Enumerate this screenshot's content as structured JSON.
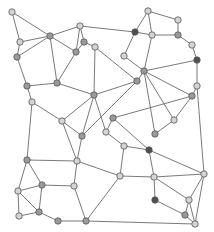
{
  "diagram": {
    "type": "graph",
    "colors": {
      "light": "#d4d4d4",
      "mid": "#9a9a9a",
      "dark": "#505050",
      "edge": "#6a6a6a",
      "node_stroke": "#555555"
    },
    "nodes": [
      {
        "id": 0,
        "x": 12,
        "y": 12,
        "shade": "light"
      },
      {
        "id": 1,
        "x": 20,
        "y": 42,
        "shade": "light"
      },
      {
        "id": 2,
        "x": 17,
        "y": 57,
        "shade": "mid"
      },
      {
        "id": 3,
        "x": 50,
        "y": 36,
        "shade": "mid"
      },
      {
        "id": 4,
        "x": 80,
        "y": 26,
        "shade": "light"
      },
      {
        "id": 5,
        "x": 84,
        "y": 42,
        "shade": "mid"
      },
      {
        "id": 6,
        "x": 76,
        "y": 52,
        "shade": "mid"
      },
      {
        "id": 7,
        "x": 95,
        "y": 47,
        "shade": "light"
      },
      {
        "id": 8,
        "x": 135,
        "y": 32,
        "shade": "dark"
      },
      {
        "id": 9,
        "x": 124,
        "y": 56,
        "shade": "light"
      },
      {
        "id": 10,
        "x": 148,
        "y": 11,
        "shade": "light"
      },
      {
        "id": 11,
        "x": 178,
        "y": 20,
        "shade": "light"
      },
      {
        "id": 12,
        "x": 152,
        "y": 35,
        "shade": "light"
      },
      {
        "id": 13,
        "x": 178,
        "y": 35,
        "shade": "mid"
      },
      {
        "id": 14,
        "x": 192,
        "y": 45,
        "shade": "light"
      },
      {
        "id": 15,
        "x": 197,
        "y": 60,
        "shade": "dark"
      },
      {
        "id": 16,
        "x": 144,
        "y": 71,
        "shade": "mid"
      },
      {
        "id": 17,
        "x": 137,
        "y": 81,
        "shade": "mid"
      },
      {
        "id": 18,
        "x": 27,
        "y": 86,
        "shade": "mid"
      },
      {
        "id": 19,
        "x": 57,
        "y": 83,
        "shade": "mid"
      },
      {
        "id": 20,
        "x": 32,
        "y": 102,
        "shade": "light"
      },
      {
        "id": 21,
        "x": 94,
        "y": 95,
        "shade": "mid"
      },
      {
        "id": 22,
        "x": 62,
        "y": 121,
        "shade": "light"
      },
      {
        "id": 23,
        "x": 113,
        "y": 118,
        "shade": "mid"
      },
      {
        "id": 24,
        "x": 106,
        "y": 132,
        "shade": "light"
      },
      {
        "id": 25,
        "x": 82,
        "y": 136,
        "shade": "mid"
      },
      {
        "id": 26,
        "x": 124,
        "y": 146,
        "shade": "light"
      },
      {
        "id": 27,
        "x": 197,
        "y": 86,
        "shade": "light"
      },
      {
        "id": 28,
        "x": 192,
        "y": 96,
        "shade": "mid"
      },
      {
        "id": 29,
        "x": 174,
        "y": 120,
        "shade": "light"
      },
      {
        "id": 30,
        "x": 155,
        "y": 134,
        "shade": "mid"
      },
      {
        "id": 31,
        "x": 149,
        "y": 150,
        "shade": "dark"
      },
      {
        "id": 32,
        "x": 27,
        "y": 160,
        "shade": "mid"
      },
      {
        "id": 33,
        "x": 77,
        "y": 161,
        "shade": "light"
      },
      {
        "id": 34,
        "x": 120,
        "y": 176,
        "shade": "light"
      },
      {
        "id": 35,
        "x": 42,
        "y": 185,
        "shade": "mid"
      },
      {
        "id": 36,
        "x": 18,
        "y": 191,
        "shade": "light"
      },
      {
        "id": 37,
        "x": 19,
        "y": 216,
        "shade": "light"
      },
      {
        "id": 38,
        "x": 39,
        "y": 212,
        "shade": "mid"
      },
      {
        "id": 39,
        "x": 58,
        "y": 221,
        "shade": "mid"
      },
      {
        "id": 40,
        "x": 86,
        "y": 221,
        "shade": "mid"
      },
      {
        "id": 41,
        "x": 204,
        "y": 174,
        "shade": "light"
      },
      {
        "id": 42,
        "x": 154,
        "y": 177,
        "shade": "light"
      },
      {
        "id": 43,
        "x": 155,
        "y": 200,
        "shade": "dark"
      },
      {
        "id": 44,
        "x": 189,
        "y": 200,
        "shade": "light"
      },
      {
        "id": 45,
        "x": 185,
        "y": 215,
        "shade": "mid"
      },
      {
        "id": 46,
        "x": 195,
        "y": 224,
        "shade": "light"
      },
      {
        "id": 47,
        "x": 74,
        "y": 186,
        "shade": "light"
      }
    ],
    "edges": [
      [
        0,
        1
      ],
      [
        0,
        3
      ],
      [
        1,
        3
      ],
      [
        1,
        2
      ],
      [
        2,
        3
      ],
      [
        3,
        4
      ],
      [
        3,
        6
      ],
      [
        3,
        19
      ],
      [
        4,
        5
      ],
      [
        4,
        6
      ],
      [
        4,
        8
      ],
      [
        5,
        7
      ],
      [
        5,
        6
      ],
      [
        6,
        19
      ],
      [
        7,
        21
      ],
      [
        7,
        17
      ],
      [
        8,
        9
      ],
      [
        9,
        16
      ],
      [
        8,
        10
      ],
      [
        8,
        12
      ],
      [
        10,
        11
      ],
      [
        10,
        12
      ],
      [
        11,
        13
      ],
      [
        12,
        13
      ],
      [
        13,
        14
      ],
      [
        14,
        15
      ],
      [
        15,
        27
      ],
      [
        12,
        16
      ],
      [
        16,
        17
      ],
      [
        16,
        15
      ],
      [
        16,
        28
      ],
      [
        16,
        29
      ],
      [
        16,
        30
      ],
      [
        17,
        21
      ],
      [
        17,
        25
      ],
      [
        2,
        18
      ],
      [
        18,
        19
      ],
      [
        18,
        20
      ],
      [
        19,
        21
      ],
      [
        21,
        22
      ],
      [
        21,
        24
      ],
      [
        21,
        25
      ],
      [
        20,
        22
      ],
      [
        20,
        32
      ],
      [
        22,
        33
      ],
      [
        22,
        25
      ],
      [
        23,
        24
      ],
      [
        23,
        28
      ],
      [
        23,
        31
      ],
      [
        24,
        26
      ],
      [
        25,
        33
      ],
      [
        26,
        31
      ],
      [
        26,
        34
      ],
      [
        28,
        27
      ],
      [
        27,
        41
      ],
      [
        28,
        29
      ],
      [
        29,
        30
      ],
      [
        31,
        42
      ],
      [
        31,
        41
      ],
      [
        32,
        33
      ],
      [
        32,
        35
      ],
      [
        32,
        36
      ],
      [
        33,
        34
      ],
      [
        33,
        47
      ],
      [
        34,
        42
      ],
      [
        34,
        40
      ],
      [
        35,
        36
      ],
      [
        35,
        38
      ],
      [
        35,
        47
      ],
      [
        36,
        37
      ],
      [
        36,
        38
      ],
      [
        37,
        38
      ],
      [
        38,
        39
      ],
      [
        39,
        40
      ],
      [
        40,
        47
      ],
      [
        40,
        46
      ],
      [
        42,
        41
      ],
      [
        42,
        43
      ],
      [
        42,
        44
      ],
      [
        43,
        45
      ],
      [
        44,
        41
      ],
      [
        44,
        45
      ],
      [
        44,
        46
      ],
      [
        45,
        46
      ],
      [
        41,
        46
      ]
    ]
  }
}
